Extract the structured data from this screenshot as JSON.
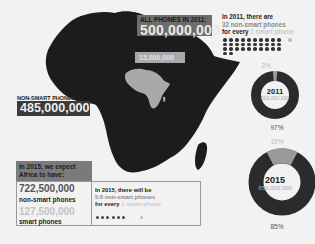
{
  "map": {
    "all_phones_label": "ALL PHONES IN 2011:",
    "all_phones_value": "500,000,000",
    "smart_phones_2011_value": "15,000,000",
    "non_smart_label": "NON-SMART PHONES",
    "non_smart_value": "485,000,000"
  },
  "stat_2011": {
    "line1": "In 2011, there are",
    "line2": "32 non-smart phones",
    "line3_prefix": "for every",
    "line3_suffix": "1 smart phone",
    "dark_dots": 32,
    "light_dots": 1
  },
  "donut_2011": {
    "year": "2011",
    "total": "500,000,000",
    "smart_pct": "3%",
    "non_smart_pct": "97%"
  },
  "donut_2015": {
    "year": "2015",
    "total": "850,000,000",
    "smart_pct": "15%",
    "non_smart_pct": "85%"
  },
  "forecast_2015": {
    "header_line1": "In 2015, we expect",
    "header_line2": "Africa to have:",
    "non_smart_value": "722,500,000",
    "non_smart_label": "non-smart phones",
    "smart_value": "127,500,000",
    "smart_label": "smart phones",
    "ratio_line1": "In 2015, there will be",
    "ratio_line2": "5.6 non-smart phones",
    "ratio_line3_prefix": "for every",
    "ratio_line3_suffix": "1 smart phone",
    "dark_dots": 6,
    "light_dots": 1
  },
  "colors": {
    "background": "#f2f2f2",
    "dark": "#222222",
    "mid_gray": "#6d6d6d",
    "light_gray": "#a9a9a9",
    "donut_dark": "#2b2b2b",
    "donut_light": "#9a9a9a"
  },
  "chart_data": [
    {
      "type": "pie",
      "title": "2011",
      "subtitle": "500,000,000",
      "categories": [
        "smart phones",
        "non-smart phones"
      ],
      "values": [
        3,
        97
      ],
      "units": "%"
    },
    {
      "type": "pie",
      "title": "2015",
      "subtitle": "850,000,000",
      "categories": [
        "smart phones",
        "non-smart phones"
      ],
      "values": [
        15,
        85
      ],
      "units": "%"
    }
  ]
}
